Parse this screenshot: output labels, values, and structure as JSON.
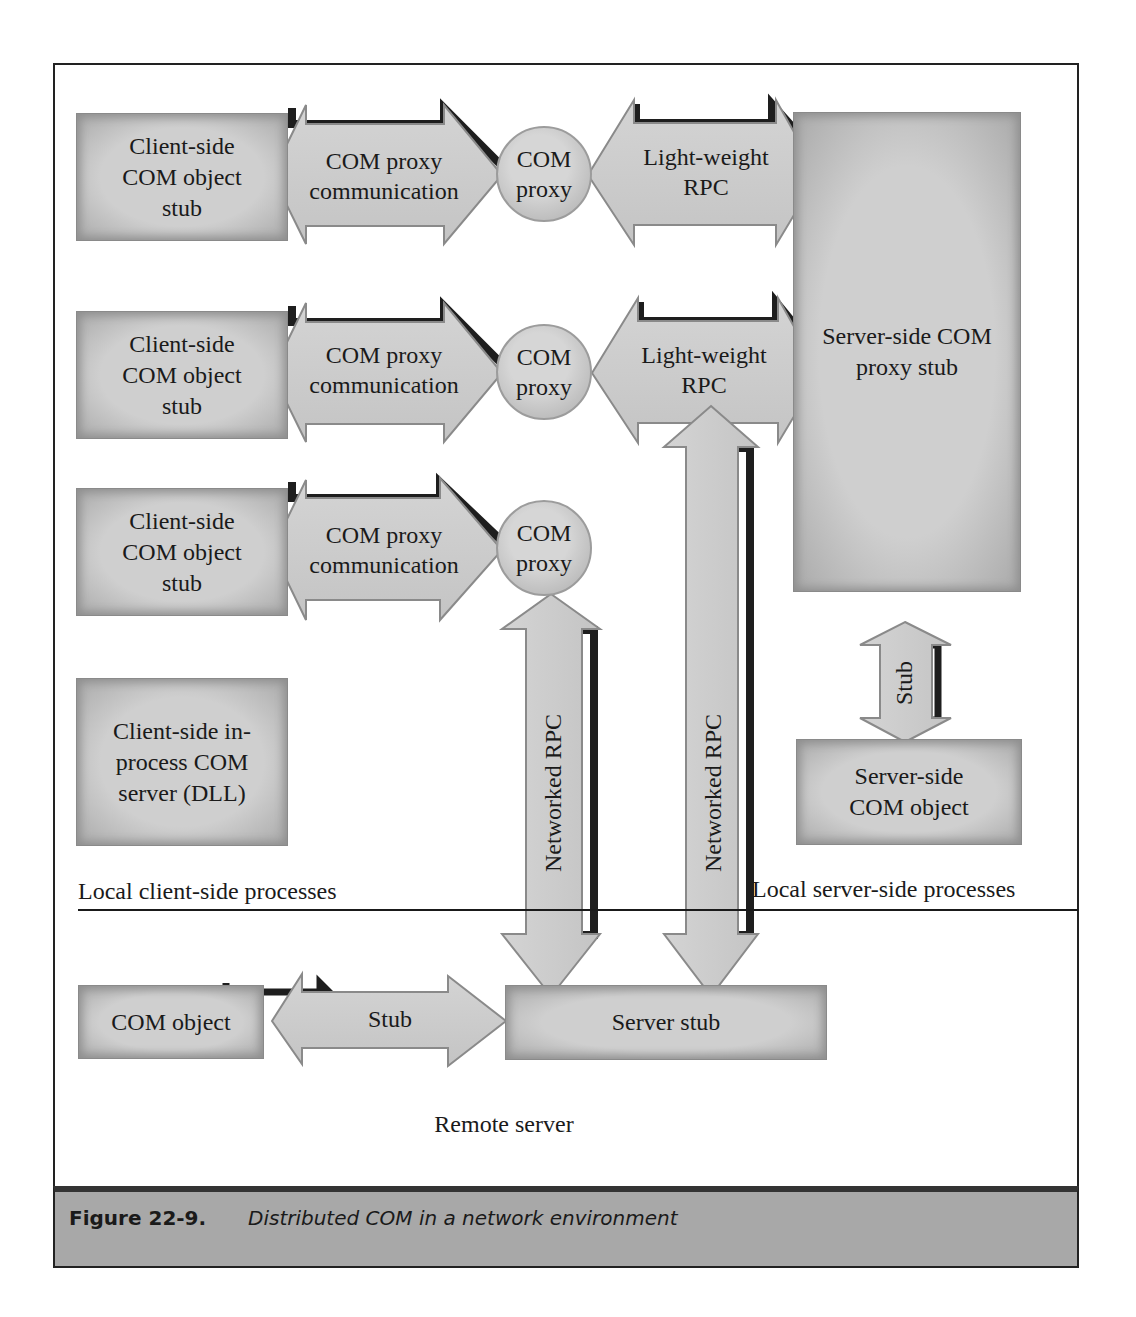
{
  "figure": {
    "number": "Figure 22-9.",
    "caption": "Distributed COM in a network environment"
  },
  "client_side": {
    "region_label": "Local client-side processes",
    "rows": [
      {
        "box_label": "Client-side COM object stub",
        "arrow_label": "COM proxy communication",
        "proxy_label": "COM proxy",
        "lrpc_label": "Light-weight RPC"
      },
      {
        "box_label": "Client-side COM object stub",
        "arrow_label": "COM proxy communication",
        "proxy_label": "COM proxy",
        "lrpc_label": "Light-weight RPC"
      },
      {
        "box_label": "Client-side COM object stub",
        "arrow_label": "COM proxy communication",
        "proxy_label": "COM proxy"
      }
    ],
    "dll_box_label": "Client-side in-process COM server (DLL)"
  },
  "server_side": {
    "region_label": "Local server-side processes",
    "proxy_stub_label": "Server-side COM proxy stub",
    "stub_arrow_label": "Stub",
    "object_label": "Server-side COM object"
  },
  "network": {
    "left_rpc_label": "Networked RPC",
    "right_rpc_label": "Networked RPC"
  },
  "remote": {
    "region_label": "Remote server",
    "object_label": "COM object",
    "stub_arrow_label": "Stub",
    "server_stub_label": "Server stub"
  },
  "colors": {
    "shape_fill": "#cfcfcf",
    "shape_edge": "#8e8e8e",
    "shadow": "#1e1e1e",
    "caption_bar": "#a8a8a8",
    "frame": "#222222"
  }
}
